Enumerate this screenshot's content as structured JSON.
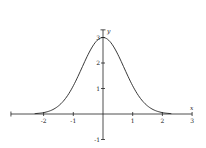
{
  "chart_data": {
    "type": "line",
    "title": "",
    "xlabel": "x",
    "ylabel": "y",
    "function": "y = 3·e^(-x²)",
    "xlim": [
      -3.1,
      3
    ],
    "ylim": [
      -1,
      3.3
    ],
    "grid": false,
    "legend": null,
    "x_ticks": [
      -2,
      -1,
      1,
      2,
      3
    ],
    "x_tick_labels": [
      "-2",
      "-1",
      "1",
      "2",
      "3"
    ],
    "y_ticks": [
      -1,
      1,
      2,
      3
    ],
    "y_tick_labels": [
      "-1",
      "1",
      "2",
      "3"
    ],
    "series": [
      {
        "name": "curve",
        "x": [
          -2.3,
          -2.0,
          -1.75,
          -1.5,
          -1.25,
          -1.0,
          -0.75,
          -0.5,
          -0.25,
          0,
          0.25,
          0.5,
          0.75,
          1.0,
          1.25,
          1.5,
          1.75,
          2.0,
          2.3
        ],
        "y": [
          0.015,
          0.055,
          0.14,
          0.32,
          0.63,
          1.1,
          1.71,
          2.34,
          2.82,
          3.0,
          2.82,
          2.34,
          1.71,
          1.1,
          0.63,
          0.32,
          0.14,
          0.055,
          0.015
        ]
      }
    ]
  }
}
